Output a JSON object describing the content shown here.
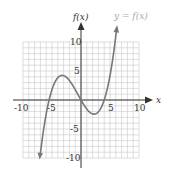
{
  "chart_data": {
    "type": "line",
    "title": "",
    "xlabel": "x",
    "ylabel": "f(x)",
    "curve_label": "y = f(x)",
    "xlim": [
      -10,
      10
    ],
    "ylim": [
      -10,
      10
    ],
    "grid": true,
    "x_ticks": [
      "-10",
      "-5",
      "5",
      "10"
    ],
    "y_ticks": [
      "10",
      "5",
      "-5",
      "-10"
    ],
    "series": [
      {
        "name": "y = f(x)",
        "x": [
          -7,
          -6,
          -5.5,
          -5,
          -4,
          -3.5,
          -3,
          -2,
          -1,
          0,
          1,
          2,
          3,
          4,
          5,
          6
        ],
        "values": [
          -9.2,
          -2.4,
          0,
          1.8,
          3.8,
          3.9,
          4.2,
          3.2,
          1.8,
          0,
          -1.6,
          -2.4,
          -2.0,
          0,
          3.8,
          11.0
        ]
      }
    ],
    "roots": [
      -5.5,
      0,
      4
    ],
    "local_max": [
      -3.3,
      4.2
    ],
    "local_min": [
      2.2,
      -2.4
    ]
  }
}
